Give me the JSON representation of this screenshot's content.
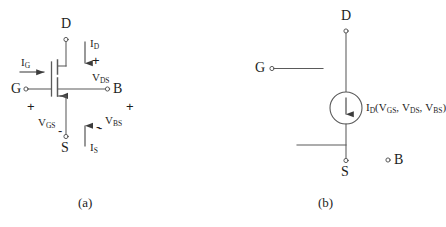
{
  "figure": {
    "background_color": "#ffffff",
    "line_color": "#4a4a4a",
    "text_color": "#1d1d1d"
  },
  "panel_a": {
    "caption": "(a)",
    "terminals": {
      "drain": "D",
      "gate": "G",
      "bulk": "B",
      "source": "S"
    },
    "currents": {
      "gate": {
        "symbol": "I",
        "sub": "G"
      },
      "drain": {
        "symbol": "I",
        "sub": "D"
      },
      "source": {
        "symbol": "I",
        "sub": "S"
      }
    },
    "voltages": {
      "vds": {
        "symbol": "V",
        "sub": "DS",
        "plus": "+",
        "minus": "-"
      },
      "vgs": {
        "symbol": "V",
        "sub": "GS",
        "plus": "+",
        "minus": "-"
      },
      "vbs": {
        "symbol": "V",
        "sub": "BS",
        "plus": "+",
        "minus": "-"
      }
    }
  },
  "panel_b": {
    "caption": "(b)",
    "terminals": {
      "drain": "D",
      "gate": "G",
      "bulk": "B",
      "source": "S"
    },
    "source_label": {
      "symbol": "I",
      "sub": "D",
      "open_paren": "(",
      "arg1_symbol": "V",
      "arg1_sub": "GS",
      "comma1": ",",
      "arg2_symbol": "V",
      "arg2_sub": "DS",
      "comma2": ",",
      "arg3_symbol": "V",
      "arg3_sub": "BS",
      "close_paren": ")"
    }
  }
}
